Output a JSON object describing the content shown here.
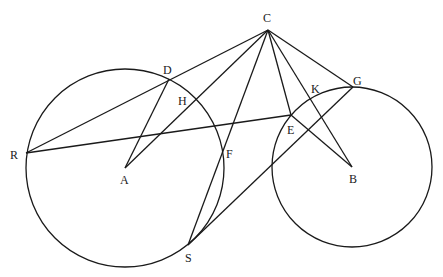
{
  "diagram": {
    "type": "geometry",
    "colors": {
      "stroke": "#1a1a1a",
      "background": "#ffffff"
    },
    "points": {
      "A": {
        "label": "A",
        "x": 125,
        "y": 168
      },
      "B": {
        "label": "B",
        "x": 352,
        "y": 167
      },
      "C": {
        "label": "C",
        "x": 268,
        "y": 30
      },
      "D": {
        "label": "D",
        "x": 169,
        "y": 79
      },
      "E": {
        "label": "E",
        "x": 291,
        "y": 115
      },
      "F": {
        "label": "F",
        "x": 222,
        "y": 153
      },
      "G": {
        "label": "G",
        "x": 353,
        "y": 87
      },
      "H": {
        "label": "H",
        "x": 196,
        "y": 99
      },
      "K": {
        "label": "K",
        "x": 311,
        "y": 100
      },
      "R": {
        "label": "R",
        "x": 26,
        "y": 153
      },
      "S": {
        "label": "S",
        "x": 188,
        "y": 245
      }
    },
    "circles": [
      {
        "center": "A",
        "radius": 99
      },
      {
        "center": "B",
        "radius": 80
      }
    ],
    "segments": [
      [
        "R",
        "C"
      ],
      [
        "D",
        "A"
      ],
      [
        "C",
        "A"
      ],
      [
        "C",
        "S"
      ],
      [
        "C",
        "E"
      ],
      [
        "C",
        "B"
      ],
      [
        "C",
        "G"
      ],
      [
        "R",
        "E"
      ],
      [
        "E",
        "B"
      ],
      [
        "G",
        "S"
      ]
    ]
  }
}
